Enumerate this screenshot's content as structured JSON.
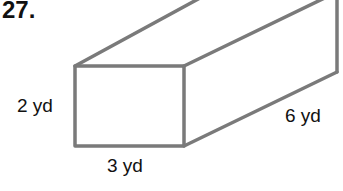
{
  "problem": {
    "number": "27."
  },
  "figure": {
    "type": "rectangular-prism",
    "stroke_color": "#7a7a7a",
    "dimensions": {
      "height": "2 yd",
      "width": "3 yd",
      "length": "6 yd"
    }
  }
}
